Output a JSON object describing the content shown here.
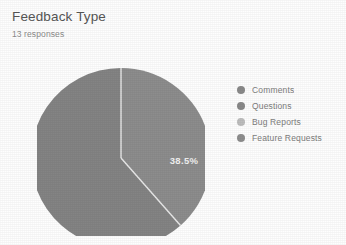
{
  "header": {
    "title": "Feedback Type",
    "subtitle": "13 responses"
  },
  "legend": {
    "items": [
      {
        "label": "Comments",
        "color": "#8a8a8a"
      },
      {
        "label": "Questions",
        "color": "#898989"
      },
      {
        "label": "Bug Reports",
        "color": "#bdbdbd"
      },
      {
        "label": "Feature Requests",
        "color": "#8e8e8e"
      }
    ]
  },
  "chart_data": {
    "type": "pie",
    "title": "Feedback Type",
    "subtitle": "13 responses",
    "total_responses": 13,
    "categories": [
      "Comments",
      "Questions",
      "Bug Reports",
      "Feature Requests"
    ],
    "values": [
      38.5,
      61.5,
      0,
      0
    ],
    "value_unit": "percent",
    "visible_slice_labels": [
      "38.5%",
      "61.5%"
    ],
    "slices": [
      {
        "label": "Comments",
        "percent": 38.5,
        "display": "38.5%",
        "color": "#8d8d8d",
        "start_deg": 0,
        "end_deg": 138.6,
        "label_x": 147,
        "label_y": 96
      },
      {
        "label": "Questions",
        "percent": 61.5,
        "display": "61.5%",
        "color": "#848484",
        "start_deg": 138.6,
        "end_deg": 360,
        "label_x": 102,
        "label_y": 220
      },
      {
        "label": "Bug Reports",
        "percent": 0,
        "display": "",
        "color": "#bdbdbd",
        "start_deg": 360,
        "end_deg": 360,
        "label_x": 0,
        "label_y": 0
      },
      {
        "label": "Feature Requests",
        "percent": 0,
        "display": "",
        "color": "#8e8e8e",
        "start_deg": 360,
        "end_deg": 360,
        "label_x": 0,
        "label_y": 0
      }
    ],
    "legend_position": "right",
    "grid": false
  },
  "style": {
    "background": "#fefefe",
    "title_color": "#565656",
    "subtitle_color": "#8c8c8c",
    "legend_text_color": "#7d7d7d",
    "slice_label_color": "#f2f2f2",
    "slice_divider_color": "#e9e9e9"
  }
}
